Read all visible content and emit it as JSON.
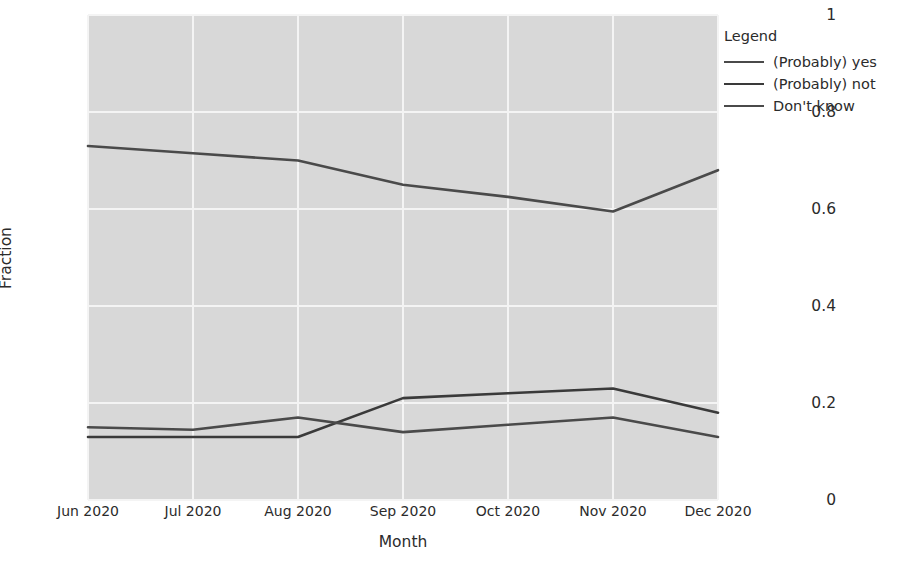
{
  "chart_data": {
    "type": "line",
    "title": "",
    "xlabel": "Month",
    "ylabel": "Fraction",
    "categories": [
      "Jun 2020",
      "Jul 2020",
      "Aug 2020",
      "Sep 2020",
      "Oct 2020",
      "Nov 2020",
      "Dec 2020"
    ],
    "xtick_labels": [
      "Jun 2020",
      "Jul 2020",
      "Aug 2020",
      "Sep 2020",
      "Oct 2020",
      "Nov 2020",
      "Dec 2020"
    ],
    "ytick_labels": [
      "0",
      "0.2",
      "0.4",
      "0.6",
      "0.8",
      "1"
    ],
    "ytick_values": [
      0,
      0.2,
      0.4,
      0.6,
      0.8,
      1
    ],
    "ylim": [
      0,
      1
    ],
    "grid": true,
    "grid_color": "#f4f4f4",
    "plot_background": "#d8d8d8",
    "figure_background": "#ffffff",
    "legend_position": "right",
    "series": [
      {
        "name": "(Probably) yes",
        "color": "#4a4a4a",
        "values": [
          0.73,
          0.715,
          0.7,
          0.65,
          0.625,
          0.595,
          0.68
        ]
      },
      {
        "name": "(Probably) not",
        "color": "#3a3a3a",
        "values": [
          0.13,
          0.13,
          0.13,
          0.21,
          0.22,
          0.23,
          0.18
        ]
      },
      {
        "name": "Don't know",
        "color": "#4a4a4a",
        "values": [
          0.15,
          0.145,
          0.17,
          0.14,
          0.155,
          0.17,
          0.13
        ]
      }
    ]
  },
  "legend": {
    "title": "Legend",
    "entries": [
      {
        "label": "(Probably) yes"
      },
      {
        "label": "(Probably) not"
      },
      {
        "label": "Don't know"
      }
    ]
  }
}
